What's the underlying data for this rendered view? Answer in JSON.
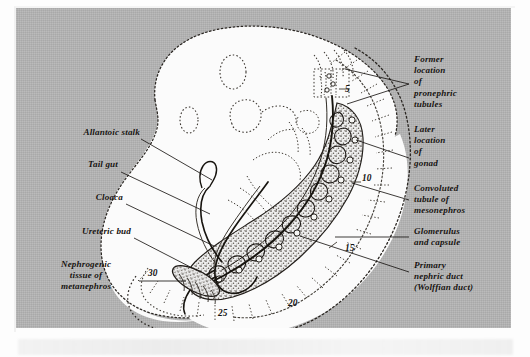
{
  "figure": {
    "kind": "embryology-plate",
    "plate_background_color": "#b4b4b4",
    "ink_color": "#1a1714",
    "tissue_fill_color": "#fbfbfb"
  },
  "labels_left": [
    {
      "id": "allantoic-stalk",
      "text": "Allantoic stalk",
      "align": "right"
    },
    {
      "id": "tail-gut",
      "text": "Tail gut",
      "align": "right"
    },
    {
      "id": "cloaca",
      "text": "Cloaca",
      "align": "right"
    },
    {
      "id": "ureteric-bud",
      "text": "Ureteric bud",
      "align": "right"
    },
    {
      "id": "nephrogenic-tissue",
      "text": "Nephrogenic\ntissue of\nmetanephros",
      "align": "center"
    }
  ],
  "labels_right": [
    {
      "id": "former-location-pronephric-tubules",
      "text": "Former\nlocation\nof\npronephric\ntubules",
      "align": "left"
    },
    {
      "id": "later-location-gonad",
      "text": "Later\nlocation\nof\ngonad",
      "align": "left"
    },
    {
      "id": "convoluted-tubule-mesonephros",
      "text": "Convoluted\ntubule of\nmesonephros",
      "align": "left"
    },
    {
      "id": "glomerulus-and-capsule",
      "text": "Glomerulus\nand capsule",
      "align": "left"
    },
    {
      "id": "primary-nephric-duct",
      "text": "Primary\nnephric duct\n(Wolffian duct)",
      "align": "left"
    }
  ],
  "somite_numbers": [
    {
      "id": "somite-5",
      "value": "5"
    },
    {
      "id": "somite-10",
      "value": "10"
    },
    {
      "id": "somite-15",
      "value": "15"
    },
    {
      "id": "somite-20",
      "value": "20"
    },
    {
      "id": "somite-25",
      "value": "25"
    },
    {
      "id": "somite-30",
      "value": "30"
    }
  ]
}
